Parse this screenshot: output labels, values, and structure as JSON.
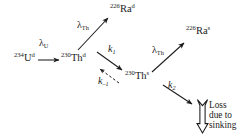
{
  "figure": {
    "kind": "reaction-decay-scheme",
    "background_color": "#ffffff",
    "ink_color": "#1b1b1b",
    "width": 243,
    "height": 137
  },
  "nodes": [
    {
      "id": "u234d",
      "mass": "234",
      "element": "U",
      "phase": "d",
      "x": 14,
      "y": 58
    },
    {
      "id": "th230d",
      "mass": "230",
      "element": "Th",
      "phase": "d",
      "x": 62,
      "y": 58
    },
    {
      "id": "ra226d",
      "mass": "226",
      "element": "Ra",
      "phase": "d",
      "x": 112,
      "y": 8
    },
    {
      "id": "th230s",
      "mass": "230",
      "element": "Th",
      "phase": "s",
      "x": 126,
      "y": 75
    },
    {
      "id": "ra226s",
      "mass": "226",
      "element": "Ra",
      "phase": "s",
      "x": 187,
      "y": 30
    }
  ],
  "rate_labels": [
    {
      "id": "lambda-u",
      "symbol": "λ",
      "sub": "U",
      "x": 39,
      "y": 42
    },
    {
      "id": "lambda-th-dissolved",
      "symbol": "λ",
      "sub": "Th",
      "x": 78,
      "y": 23
    },
    {
      "id": "k1",
      "symbol": "k",
      "sub": "1",
      "x": 108,
      "y": 47
    },
    {
      "id": "k-minus-1",
      "symbol": "k",
      "sub": "–1",
      "x": 99,
      "y": 76
    },
    {
      "id": "lambda-th-sinking",
      "symbol": "λ",
      "sub": "Th",
      "x": 154,
      "y": 48
    },
    {
      "id": "k2",
      "symbol": "k",
      "sub": "2",
      "x": 168,
      "y": 82
    }
  ],
  "loss": {
    "lines": [
      "Loss",
      "due to",
      "sinking"
    ],
    "x": 207,
    "y": 98
  },
  "arrows": [
    {
      "id": "u-to-th",
      "style": "solid",
      "from": "u234d",
      "to": "th230d"
    },
    {
      "id": "th-d-to-ra-d",
      "style": "solid",
      "from": "th230d",
      "to": "ra226d"
    },
    {
      "id": "th-d-to-th-s",
      "style": "solid",
      "from": "th230d",
      "to": "th230s"
    },
    {
      "id": "th-s-to-th-d",
      "style": "dashed",
      "from": "th230s",
      "to": "th230d"
    },
    {
      "id": "th-s-to-ra-s",
      "style": "solid",
      "from": "th230s",
      "to": "ra226s"
    },
    {
      "id": "th-s-to-loss",
      "style": "solid",
      "from": "th230s",
      "to": "loss"
    },
    {
      "id": "sinking-outline-arrow",
      "style": "hollow-down",
      "from": "loss",
      "to": "loss"
    }
  ]
}
